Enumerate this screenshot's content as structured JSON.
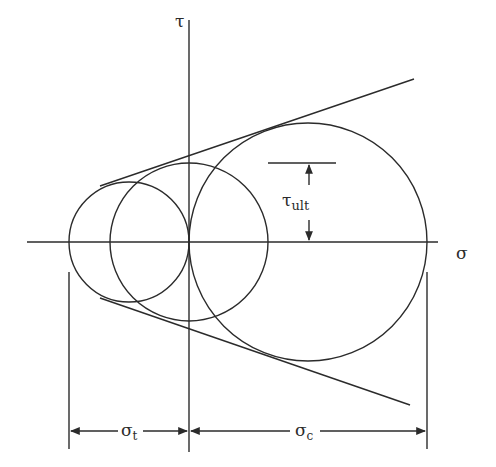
{
  "diagram": {
    "type": "mohr_failure_envelope",
    "axes": {
      "horizontal_label": "σ",
      "vertical_label": "τ"
    },
    "circles": [
      {
        "name": "uniaxial-tension-circle"
      },
      {
        "name": "pure-shear-circle"
      },
      {
        "name": "uniaxial-compression-circle"
      }
    ],
    "annotations": {
      "tau_ult_main": "τ",
      "tau_ult_sub": "ult",
      "sigma_t_main": "σ",
      "sigma_t_sub": "t",
      "sigma_c_main": "σ",
      "sigma_c_sub": "c"
    }
  }
}
